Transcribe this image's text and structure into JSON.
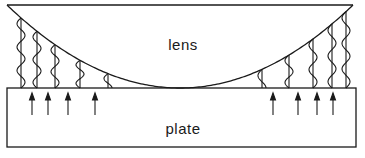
{
  "diagram": {
    "labels": {
      "lens": "lens",
      "plate": "plate"
    },
    "colors": {
      "stroke": "#1a1a1a",
      "background": "#ffffff"
    },
    "lens": {
      "top_y": 5,
      "left_x": 7,
      "right_x": 353,
      "bottom_x": 180,
      "bottom_y": 88
    },
    "plate": {
      "x": 7,
      "y": 88,
      "width": 349,
      "height": 59
    },
    "left_waves": [
      {
        "x": 21,
        "top": 25,
        "cycles": 3
      },
      {
        "x": 37,
        "top": 40,
        "cycles": 2.5
      },
      {
        "x": 55,
        "top": 52,
        "cycles": 2
      },
      {
        "x": 80,
        "top": 66,
        "cycles": 1.5
      },
      {
        "x": 108,
        "top": 78,
        "cycles": 0.75
      }
    ],
    "right_waves": [
      {
        "x": 262,
        "top": 75,
        "cycles": 0.75
      },
      {
        "x": 289,
        "top": 63,
        "cycles": 1.5
      },
      {
        "x": 313,
        "top": 46,
        "cycles": 2
      },
      {
        "x": 332,
        "top": 35,
        "cycles": 2.5
      },
      {
        "x": 346,
        "top": 22,
        "cycles": 3
      }
    ],
    "arrows": [
      {
        "x": 32
      },
      {
        "x": 48
      },
      {
        "x": 68
      },
      {
        "x": 95
      },
      {
        "x": 273
      },
      {
        "x": 298
      },
      {
        "x": 317
      },
      {
        "x": 333
      }
    ]
  }
}
